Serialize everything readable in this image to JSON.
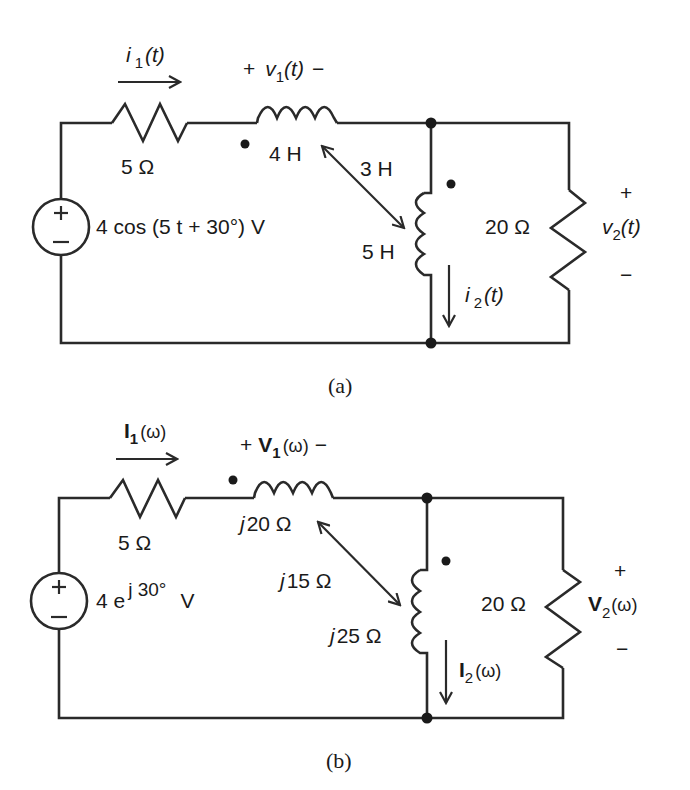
{
  "figure_a": {
    "caption": "(a)",
    "source": {
      "label": "4 cos (5 t + 30°)  V",
      "plus": "+",
      "minus": "−"
    },
    "current_1": {
      "symbol": "i",
      "subscript": "1",
      "arg": "(t)"
    },
    "voltage_1": {
      "plus": "+",
      "symbol": "v",
      "subscript": "1",
      "arg": "(t)",
      "minus": "−"
    },
    "resistor_1": {
      "label": "5 Ω"
    },
    "inductor_1": {
      "label": "4 H"
    },
    "mutual": {
      "label": "3 H"
    },
    "inductor_2": {
      "label": "5 H"
    },
    "resistor_2": {
      "label": "20 Ω"
    },
    "current_2": {
      "symbol": "i",
      "subscript": "2",
      "arg": "(t)"
    },
    "voltage_2": {
      "plus": "+",
      "symbol": "v",
      "subscript": "2",
      "arg": "(t)",
      "minus": "−"
    }
  },
  "figure_b": {
    "caption": "(b)",
    "source": {
      "prefix": "4 e",
      "exponent": "j 30°",
      "unit": "V",
      "plus": "+",
      "minus": "−"
    },
    "current_1": {
      "symbol": "I",
      "subscript": "1",
      "arg": "(ω)"
    },
    "voltage_1": {
      "plus": "+",
      "symbol": "V",
      "subscript": "1",
      "arg": "(ω)",
      "minus": "−"
    },
    "resistor_1": {
      "label": "5 Ω"
    },
    "inductor_1": {
      "j": "j",
      "label": "20 Ω"
    },
    "mutual": {
      "j": "j",
      "label": "15 Ω"
    },
    "inductor_2": {
      "j": "j",
      "label": "25 Ω"
    },
    "resistor_2": {
      "label": "20 Ω"
    },
    "current_2": {
      "symbol": "I",
      "subscript": "2",
      "arg": "(ω)"
    },
    "voltage_2": {
      "plus": "+",
      "symbol": "V",
      "subscript": "2",
      "arg": "(ω)",
      "minus": "−"
    }
  }
}
